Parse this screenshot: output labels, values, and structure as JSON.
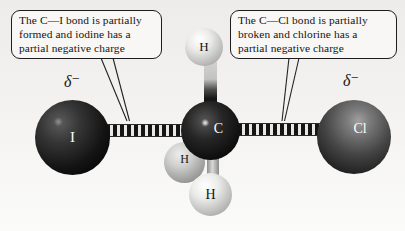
{
  "figure": {
    "background_color": "#f1f0ee",
    "callouts": {
      "left": {
        "lines": [
          "The C—I bond is partially",
          "formed and iodine has a",
          "partial negative charge"
        ]
      },
      "right": {
        "lines": [
          "The C—Cl bond is partially",
          "broken and chlorine has a",
          "partial negative charge"
        ]
      }
    },
    "charge_labels": {
      "left": "δ⁻",
      "right": "δ⁻"
    },
    "atoms": {
      "iodine": {
        "symbol": "I",
        "label_color": "#ffffff",
        "sphere": "dark"
      },
      "carbon": {
        "symbol": "C",
        "label_color": "#ffffff",
        "sphere": "black"
      },
      "chlorine": {
        "symbol": "Cl",
        "label_color": "#ffffff",
        "sphere": "dark-gray"
      },
      "hydrogen_top": {
        "symbol": "H",
        "label_color": "#161616",
        "sphere": "light"
      },
      "hydrogen_back": {
        "symbol": "H",
        "label_color": "#161616",
        "sphere": "light"
      },
      "hydrogen_bottom": {
        "symbol": "H",
        "label_color": "#161616",
        "sphere": "light"
      }
    },
    "bonds": {
      "c_i": {
        "style": "hashed-partial"
      },
      "c_cl": {
        "style": "hashed-partial"
      },
      "c_h": {
        "style": "solid-cylinder"
      }
    }
  }
}
